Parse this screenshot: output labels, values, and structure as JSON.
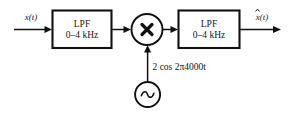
{
  "diagram": {
    "background_color": "#ffffff",
    "line_color": "#111111",
    "input": {
      "label": "x(t)",
      "name": "input-signal-label"
    },
    "output": {
      "label": "x(t)",
      "hat": true,
      "name": "output-signal-label"
    },
    "blocks": [
      {
        "id": "lpf-1",
        "line1": "LPF",
        "line2": "0–4 kHz"
      },
      {
        "id": "lpf-2",
        "line1": "LPF",
        "line2": "0–4 kHz"
      }
    ],
    "multiplier": {
      "symbol": "×",
      "name": "multiplier-node"
    },
    "oscillator": {
      "symbol": "∼",
      "label": "2 cos 2π4000t",
      "name": "local-oscillator"
    }
  }
}
